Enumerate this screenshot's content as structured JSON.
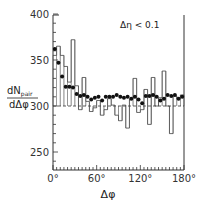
{
  "chart_data": {
    "type": "line",
    "title": "",
    "annotation": "Δη < 0.1",
    "xlabel": "Δφ",
    "ylabel_numerator": "dN",
    "ylabel_sub": "pair",
    "ylabel_denominator": "dΔφ",
    "xlim": [
      0,
      180
    ],
    "ylim": [
      230,
      400
    ],
    "x_ticks": [
      "0°",
      "60°",
      "120°",
      "180°"
    ],
    "y_ticks": [
      "250",
      "300",
      "350",
      "400"
    ],
    "reference_line": 300,
    "grid": false,
    "legend": null,
    "series": [
      {
        "name": "points (filled circles)",
        "style": "scatter",
        "x": [
          2.5,
          7.5,
          12.5,
          17.5,
          22.5,
          27.5,
          32.5,
          37.5,
          42.5,
          47.5,
          52.5,
          57.5,
          62.5,
          67.5,
          72.5,
          77.5,
          82.5,
          87.5,
          92.5,
          97.5,
          102.5,
          107.5,
          112.5,
          117.5,
          122.5,
          127.5,
          132.5,
          137.5,
          142.5,
          147.5,
          152.5,
          157.5,
          162.5,
          167.5,
          172.5,
          177.5
        ],
        "values": [
          362,
          347,
          332,
          321,
          321,
          320,
          313,
          311,
          312,
          310,
          307,
          309,
          310,
          306,
          310,
          310,
          310,
          312,
          310,
          309,
          310,
          308,
          310,
          307,
          303,
          311,
          311,
          312,
          310,
          306,
          308,
          312,
          311,
          312,
          308,
          310
        ]
      },
      {
        "name": "histogram",
        "style": "step",
        "x": [
          2.5,
          7.5,
          12.5,
          17.5,
          22.5,
          27.5,
          32.5,
          37.5,
          42.5,
          47.5,
          52.5,
          57.5,
          62.5,
          67.5,
          72.5,
          77.5,
          82.5,
          87.5,
          92.5,
          97.5,
          102.5,
          107.5,
          112.5,
          117.5,
          122.5,
          127.5,
          132.5,
          137.5,
          142.5,
          147.5,
          152.5,
          157.5,
          162.5,
          167.5,
          172.5,
          177.5
        ],
        "values": [
          355,
          365,
          355,
          343,
          326,
          372,
          322,
          296,
          331,
          305,
          294,
          298,
          306,
          290,
          296,
          308,
          301,
          290,
          284,
          301,
          276,
          307,
          330,
          293,
          296,
          318,
          280,
          331,
          300,
          309,
          338,
          300,
          270,
          311,
          308,
          312
        ]
      }
    ]
  }
}
